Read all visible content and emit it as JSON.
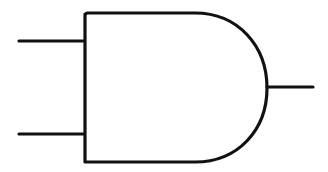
{
  "diagram": {
    "type": "logic-gate",
    "gate": "AND",
    "stroke_color": "#111111",
    "background": "#ffffff",
    "inputs": [
      {
        "name": "input-a"
      },
      {
        "name": "input-b"
      }
    ],
    "outputs": [
      {
        "name": "output"
      }
    ]
  }
}
